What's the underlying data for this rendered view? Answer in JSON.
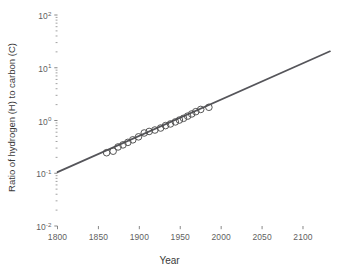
{
  "chart_data": {
    "type": "scatter",
    "title": "",
    "xlabel": "Year",
    "ylabel": "Ratio of hydrogen (H) to carbon (C)",
    "xscale": "linear",
    "yscale": "log",
    "xlim": [
      1800,
      2133
    ],
    "ylim": [
      0.01,
      100
    ],
    "grid": false,
    "legend": null,
    "xticks": [
      1800,
      1850,
      1900,
      1950,
      2000,
      2050,
      2100
    ],
    "xticklabels": [
      "1800",
      "1850",
      "1900",
      "1950",
      "2000",
      "2050",
      "2100"
    ],
    "yticks": [
      0.01,
      0.1,
      1,
      10,
      100
    ],
    "yticklabels": [
      {
        "mantissa": "10",
        "exponent": "-2",
        "value": 0.01
      },
      {
        "mantissa": "10",
        "exponent": "-1",
        "value": 0.1
      },
      {
        "mantissa": "10",
        "exponent": "0",
        "value": 1
      },
      {
        "mantissa": "10",
        "exponent": "1",
        "value": 10
      },
      {
        "mantissa": "10",
        "exponent": "2",
        "value": 100
      }
    ],
    "series": [
      {
        "name": "Observed H:C ratio",
        "marker": "open-circle",
        "marker_color": "#4d4d4d",
        "marker_size": 3.3,
        "x": [
          1860,
          1868,
          1874,
          1880,
          1886,
          1892,
          1899,
          1906,
          1912,
          1919,
          1926,
          1932,
          1938,
          1944,
          1949,
          1954,
          1959,
          1964,
          1969,
          1975,
          1985
        ],
        "y": [
          0.245,
          0.262,
          0.315,
          0.345,
          0.385,
          0.43,
          0.49,
          0.58,
          0.62,
          0.66,
          0.72,
          0.8,
          0.86,
          0.94,
          1.02,
          1.1,
          1.21,
          1.33,
          1.47,
          1.62,
          1.78
        ]
      },
      {
        "name": "Trend line",
        "type": "line",
        "line_color": "#55555a",
        "line_width": 1.7,
        "x": [
          1800,
          2133
        ],
        "y": [
          0.105,
          20.5
        ]
      }
    ]
  },
  "axes": {
    "tick_color": "#7a7a7a",
    "label_color": "#3a3a3a",
    "spine_visible": false
  }
}
